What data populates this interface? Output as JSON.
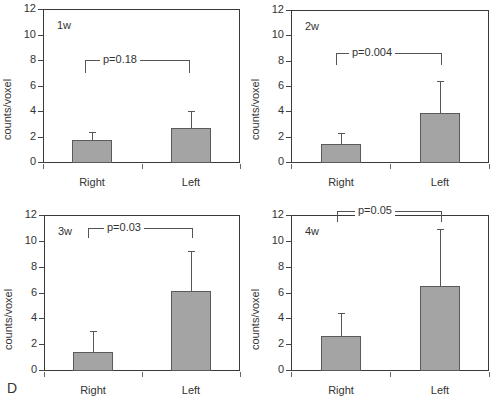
{
  "chart_data": [
    {
      "type": "bar",
      "title": "1w",
      "categories": [
        "Right",
        "Left"
      ],
      "values": [
        1.7,
        2.65
      ],
      "error_upper": [
        2.35,
        4.0
      ],
      "ylabel": "counts/voxel",
      "xlabel": "",
      "ylim": [
        0,
        12
      ],
      "yticks": [
        0,
        2,
        4,
        6,
        8,
        10,
        12
      ],
      "annotation": "p=0.18",
      "grid": false
    },
    {
      "type": "bar",
      "title": "2w",
      "categories": [
        "Right",
        "Left"
      ],
      "values": [
        1.4,
        3.9
      ],
      "error_upper": [
        2.3,
        6.4
      ],
      "ylabel": "counts/voxel",
      "xlabel": "",
      "ylim": [
        0,
        12
      ],
      "yticks": [
        0,
        2,
        4,
        6,
        8,
        10,
        12
      ],
      "annotation": "p=0.004",
      "grid": false
    },
    {
      "type": "bar",
      "title": "3w",
      "categories": [
        "Right",
        "Left"
      ],
      "values": [
        1.4,
        6.1
      ],
      "error_upper": [
        3.0,
        9.2
      ],
      "ylabel": "counts/voxel",
      "xlabel": "",
      "ylim": [
        0,
        12
      ],
      "yticks": [
        0,
        2,
        4,
        6,
        8,
        10,
        12
      ],
      "annotation": "p=0.03",
      "grid": false
    },
    {
      "type": "bar",
      "title": "4w",
      "categories": [
        "Right",
        "Left"
      ],
      "values": [
        2.65,
        6.5
      ],
      "error_upper": [
        4.4,
        10.9
      ],
      "ylabel": "counts/voxel",
      "xlabel": "",
      "ylim": [
        0,
        12
      ],
      "yticks": [
        0,
        2,
        4,
        6,
        8,
        10,
        12
      ],
      "annotation": "p=0.05",
      "grid": false
    }
  ],
  "figure": {
    "panel_letter": "D",
    "bar_color": "#a4a4a4",
    "bar_edge_color": "#5a5a5a"
  },
  "layout": [
    {
      "left": 43,
      "right": 240,
      "top": 9,
      "zero": 162,
      "bracket_y": 60,
      "bracket_drop": 13,
      "bracket_x1": 85,
      "bracket_x2": 189,
      "label_x": 100,
      "ylabel_y": 140
    },
    {
      "left": 291,
      "right": 489,
      "top": 10,
      "zero": 162,
      "bracket_y": 53,
      "bracket_drop": 12,
      "bracket_x1": 336,
      "bracket_x2": 441,
      "label_x": 349,
      "ylabel_y": 140
    },
    {
      "left": 44,
      "right": 240,
      "top": 215,
      "zero": 370,
      "bracket_y": 228,
      "bracket_drop": 10,
      "bracket_x1": 88,
      "bracket_x2": 192,
      "label_x": 104,
      "ylabel_y": 350
    },
    {
      "left": 291,
      "right": 489,
      "top": 215,
      "zero": 370,
      "bracket_y": 211,
      "bracket_drop": 11,
      "bracket_x1": 337,
      "bracket_x2": 441,
      "label_x": 355,
      "ylabel_y": 350
    }
  ]
}
